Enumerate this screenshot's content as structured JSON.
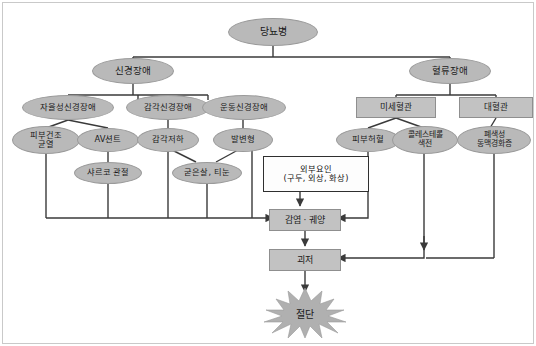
{
  "diagram": {
    "colors": {
      "ellipse_fill": "#b9b9b9",
      "rect_fill": "#c2c2c2",
      "box_stroke": "#2f2f2f",
      "line": "#3a3a3a",
      "frame": "#c9c9c9",
      "text": "#1a1a1a"
    },
    "nodes": {
      "root": {
        "label": "당뇨병",
        "shape": "ellipse"
      },
      "neuropathy": {
        "label": "신경장애",
        "shape": "ellipse"
      },
      "vascular": {
        "label": "혈류장애",
        "shape": "ellipse"
      },
      "autonomic": {
        "label": "자율성신경장애",
        "shape": "ellipse"
      },
      "sensory": {
        "label": "감각신경장애",
        "shape": "ellipse"
      },
      "motor": {
        "label": "운동신경장애",
        "shape": "ellipse"
      },
      "micro": {
        "label": "미세혈관",
        "shape": "rect"
      },
      "macro": {
        "label": "대혈관",
        "shape": "rect"
      },
      "dry_skin": {
        "label": "피부건조\n균열",
        "line1": "피부건조",
        "line2": "균열",
        "shape": "ellipse"
      },
      "av_shunt": {
        "label": "AV션트",
        "shape": "ellipse"
      },
      "hypoesthesia": {
        "label": "감각저하",
        "shape": "ellipse"
      },
      "foot_deform": {
        "label": "발변형",
        "shape": "ellipse"
      },
      "skin_ischemia": {
        "label": "피부허혈",
        "shape": "ellipse"
      },
      "cholesterol": {
        "line1": "콜레스테롤",
        "line2": "색전",
        "shape": "ellipse"
      },
      "atherosclerosis": {
        "line1": "폐색성",
        "line2": "동맥경화증",
        "shape": "ellipse"
      },
      "charcot": {
        "label": "샤르코 관절",
        "shape": "ellipse"
      },
      "callus": {
        "label": "굳은살, 티눈",
        "shape": "ellipse"
      },
      "external": {
        "line1": "외부요인",
        "line2": "(구두, 외상, 화상)",
        "shape": "rect-white"
      },
      "infection": {
        "label": "감염 · 궤양",
        "shape": "rect"
      },
      "gangrene": {
        "label": "괴저",
        "shape": "rect"
      },
      "amputation": {
        "label": "절단",
        "shape": "star"
      }
    }
  }
}
